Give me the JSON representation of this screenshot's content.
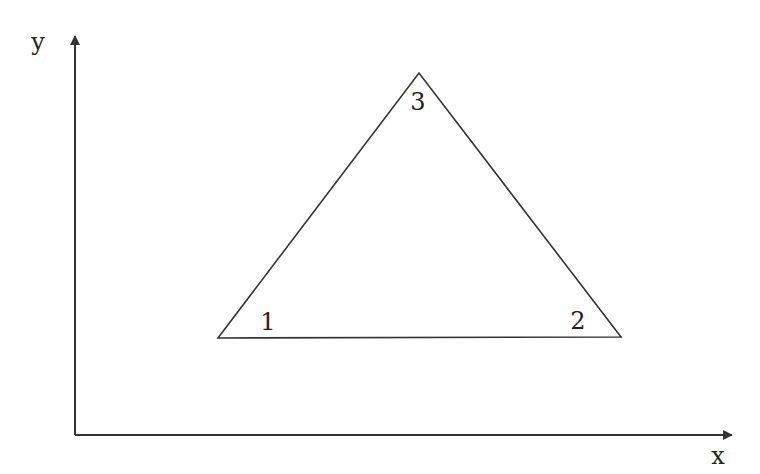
{
  "diagram": {
    "type": "triangle-in-coordinate-system",
    "colors": {
      "stroke": "#333333",
      "text": "#222222",
      "background": "#ffffff"
    },
    "axes": {
      "origin": {
        "x": 75,
        "y": 435
      },
      "x_axis": {
        "label": "x",
        "end": {
          "x": 740,
          "y": 435
        },
        "label_pos": {
          "x": 718,
          "y": 464
        }
      },
      "y_axis": {
        "label": "y",
        "end": {
          "x": 75,
          "y": 28
        },
        "label_pos": {
          "x": 38,
          "y": 50
        }
      }
    },
    "triangle": {
      "vertices": [
        {
          "id": "1",
          "label": "1",
          "x": 218,
          "y": 338,
          "label_pos": {
            "x": 268,
            "y": 330
          }
        },
        {
          "id": "2",
          "label": "2",
          "x": 621,
          "y": 337,
          "label_pos": {
            "x": 578,
            "y": 329
          }
        },
        {
          "id": "3",
          "label": "3",
          "x": 419,
          "y": 73,
          "label_pos": {
            "x": 418,
            "y": 110
          }
        }
      ]
    }
  }
}
